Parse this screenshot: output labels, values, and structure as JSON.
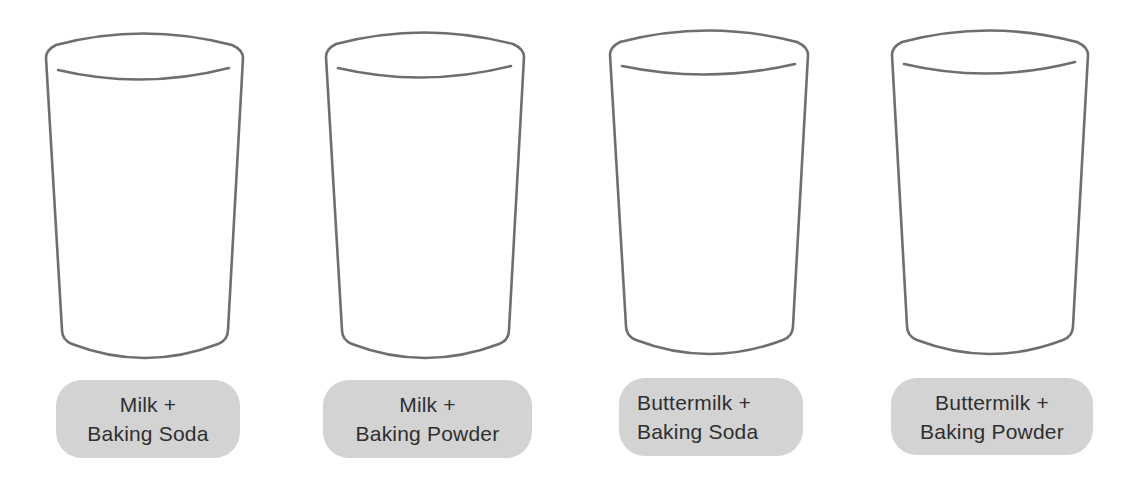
{
  "colors": {
    "outline": "#6e6e6e",
    "pill_fill": "#d3d3d3",
    "text": "#2f2f2f",
    "background": "#ffffff"
  },
  "glasses": [
    {
      "label_line1": "Milk +",
      "label_line2": "Baking Soda",
      "icon": "glass-icon"
    },
    {
      "label_line1": "Milk +",
      "label_line2": "Baking Powder",
      "icon": "glass-icon"
    },
    {
      "label_line1": "Buttermilk +",
      "label_line2": "Baking Soda",
      "icon": "glass-icon"
    },
    {
      "label_line1": "Buttermilk +",
      "label_line2": "Baking Powder",
      "icon": "glass-icon"
    }
  ]
}
